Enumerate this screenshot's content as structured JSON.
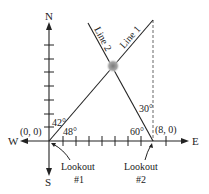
{
  "diagram": {
    "type": "navigation-bearing-diagram",
    "compass": {
      "north": "N",
      "south": "S",
      "east": "E",
      "west": "W"
    },
    "points": [
      {
        "label": "(0, 0)",
        "name": "Lookout #1 origin"
      },
      {
        "label": "(8, 0)",
        "name": "Lookout #2 position"
      }
    ],
    "lines": [
      {
        "label": "Line 1"
      },
      {
        "label": "Line 2"
      }
    ],
    "angles": {
      "a42": "42°",
      "a48": "48°",
      "a60": "60°",
      "a30": "30°"
    },
    "lookouts": [
      {
        "line1": "Lookout",
        "line2": "#1"
      },
      {
        "line1": "Lookout",
        "line2": "#2"
      }
    ],
    "colors": {
      "stroke": "#222222",
      "fire": "#9a9a9a",
      "background": "#ffffff"
    }
  }
}
